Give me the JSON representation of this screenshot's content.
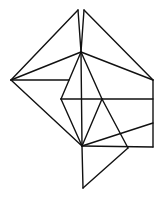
{
  "diagram": {
    "type": "geometric-line-drawing",
    "stroke_color": "#111111",
    "background": "#ffffff",
    "vertices": {
      "top_left": [
        78,
        10
      ],
      "top_right": [
        84,
        10
      ],
      "hub": [
        81,
        52
      ],
      "left": [
        11,
        80
      ],
      "left_mid": [
        69,
        80
      ],
      "right_top": [
        153,
        80
      ],
      "row_left": [
        61,
        99
      ],
      "row_mid": [
        102,
        99
      ],
      "row_right": [
        153,
        99
      ],
      "right_mid": [
        153,
        123
      ],
      "bottom_hub": [
        82,
        146
      ],
      "lower_right": [
        128,
        148
      ],
      "right_bottom": [
        153,
        147
      ],
      "bottom": [
        83,
        188
      ]
    },
    "edges": [
      [
        "left",
        "top_left"
      ],
      [
        "top_left",
        "hub"
      ],
      [
        "top_right",
        "hub"
      ],
      [
        "top_right",
        "right_top"
      ],
      [
        "left",
        "hub"
      ],
      [
        "hub",
        "right_top"
      ],
      [
        "left",
        "left_mid"
      ],
      [
        "hub",
        "row_left"
      ],
      [
        "hub",
        "row_mid"
      ],
      [
        "hub",
        "bottom_hub"
      ],
      [
        "row_left",
        "row_right"
      ],
      [
        "right_top",
        "right_bottom"
      ],
      [
        "left",
        "bottom_hub"
      ],
      [
        "row_left",
        "bottom_hub"
      ],
      [
        "row_mid",
        "bottom_hub"
      ],
      [
        "row_mid",
        "lower_right"
      ],
      [
        "bottom_hub",
        "right_mid"
      ],
      [
        "bottom_hub",
        "right_bottom"
      ],
      [
        "bottom_hub",
        "bottom"
      ],
      [
        "bottom",
        "lower_right"
      ]
    ]
  }
}
